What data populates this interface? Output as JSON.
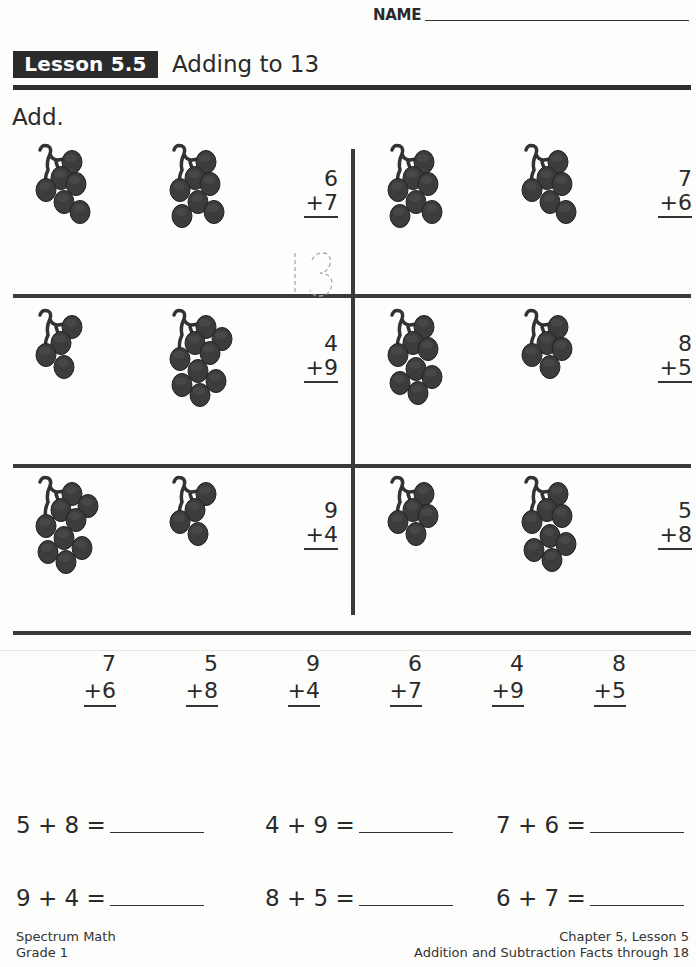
{
  "header": {
    "name_label": "NAME",
    "lesson_badge": "Lesson 5.5",
    "lesson_title": "Adding to 13",
    "instruction": "Add."
  },
  "picture_problems": [
    {
      "top": "6",
      "bottom": "+7",
      "grapes_left": 6,
      "grapes_right": 7,
      "hint_answer": "13"
    },
    {
      "top": "7",
      "bottom": "+6",
      "grapes_left": 7,
      "grapes_right": 6
    },
    {
      "top": "4",
      "bottom": "+9",
      "grapes_left": 4,
      "grapes_right": 9
    },
    {
      "top": "8",
      "bottom": "+5",
      "grapes_left": 8,
      "grapes_right": 5
    },
    {
      "top": "9",
      "bottom": "+4",
      "grapes_left": 9,
      "grapes_right": 4
    },
    {
      "top": "5",
      "bottom": "+8",
      "grapes_left": 5,
      "grapes_right": 8
    }
  ],
  "vertical_problems": [
    {
      "top": "7",
      "bottom": "+6"
    },
    {
      "top": "5",
      "bottom": "+8"
    },
    {
      "top": "9",
      "bottom": "+4"
    },
    {
      "top": "6",
      "bottom": "+7"
    },
    {
      "top": "4",
      "bottom": "+9"
    },
    {
      "top": "8",
      "bottom": "+5"
    }
  ],
  "equations": [
    {
      "text": "5 + 8 =",
      "answer": ""
    },
    {
      "text": "4 + 9 =",
      "answer": ""
    },
    {
      "text": "7 + 6 =",
      "answer": ""
    },
    {
      "text": "9 + 4 =",
      "answer": ""
    },
    {
      "text": "8 + 5 =",
      "answer": ""
    },
    {
      "text": "6 + 7 =",
      "answer": ""
    }
  ],
  "footer": {
    "left_line1": "Spectrum Math",
    "left_line2": "Grade 1",
    "right_line1": "Chapter 5, Lesson 5",
    "right_line2": "Addition and Subtraction Facts through 18"
  },
  "colors": {
    "ink": "#2a2a2a",
    "grape": "#3c3c3c",
    "rule": "#3a3a3a",
    "hint": "#aaaaaa"
  }
}
